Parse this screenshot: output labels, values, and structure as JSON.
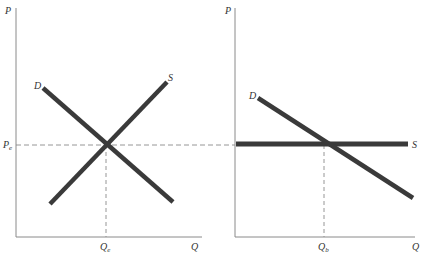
{
  "colors": {
    "background": "#ffffff",
    "axis": "#8a8a8a",
    "curve": "#3a3a3a",
    "dashed": "#8a8a8a",
    "label": "#333333"
  },
  "panels": [
    {
      "id": "left",
      "axis_labels": {
        "y": "P",
        "x": "Q"
      },
      "equilibrium": {
        "price_label": "P",
        "price_sub": "e",
        "quantity_label": "Q",
        "quantity_sub": "e"
      },
      "curves": [
        {
          "name": "D",
          "label": "D",
          "type": "downward-sloping"
        },
        {
          "name": "S",
          "label": "S",
          "type": "upward-sloping"
        }
      ]
    },
    {
      "id": "right",
      "axis_labels": {
        "y": "P",
        "x": "Q"
      },
      "equilibrium": {
        "quantity_label": "Q",
        "quantity_sub": "b"
      },
      "curves": [
        {
          "name": "D",
          "label": "D",
          "type": "downward-sloping"
        },
        {
          "name": "S",
          "label": "S",
          "type": "horizontal (perfectly elastic)"
        }
      ]
    }
  ]
}
